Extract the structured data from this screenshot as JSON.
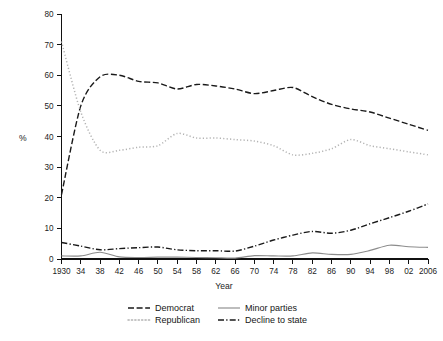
{
  "chart_data": {
    "type": "line",
    "title": "",
    "xlabel": "Year",
    "ylabel": "%",
    "xlim": [
      1930,
      2006
    ],
    "ylim": [
      0,
      80
    ],
    "grid": false,
    "legend_position": "bottom",
    "x": [
      1930,
      1934,
      1938,
      1942,
      1946,
      1950,
      1954,
      1958,
      1962,
      1966,
      1970,
      1974,
      1978,
      1982,
      1986,
      1990,
      1994,
      1998,
      2002,
      2006
    ],
    "xtick_labels": [
      "1930",
      "34",
      "38",
      "42",
      "46",
      "50",
      "54",
      "58",
      "62",
      "66",
      "70",
      "74",
      "78",
      "82",
      "86",
      "90",
      "94",
      "98",
      "02",
      "2006"
    ],
    "ytick_labels": [
      "0",
      "10",
      "20",
      "30",
      "40",
      "50",
      "60",
      "70",
      "80"
    ],
    "yticks": [
      0,
      10,
      20,
      30,
      40,
      50,
      60,
      70,
      80
    ],
    "series": [
      {
        "name": "Democrat",
        "style": "dashed",
        "color": "#1a1a1a",
        "values": [
          21,
          50,
          59.5,
          60,
          58,
          57.5,
          55.5,
          57,
          56.5,
          55.5,
          54,
          55,
          56,
          53,
          50.5,
          49,
          48,
          46,
          44,
          42
        ]
      },
      {
        "name": "Republican",
        "style": "dotted",
        "color": "#b3b3b3",
        "values": [
          71,
          48,
          35.5,
          35.5,
          36.5,
          37,
          41,
          39.5,
          39.5,
          39,
          38.5,
          37,
          34,
          34.5,
          36,
          39,
          37,
          36,
          35,
          34
        ]
      },
      {
        "name": "Minor parties",
        "style": "solid",
        "color": "#8c8c8c",
        "values": [
          1,
          1,
          2.2,
          0.7,
          0.5,
          0.6,
          0.6,
          0.5,
          0.4,
          0.3,
          1.1,
          1,
          1,
          2,
          1.5,
          1.5,
          2.8,
          4.5,
          4,
          3.8
        ]
      },
      {
        "name": "Decline to state",
        "style": "dashdot",
        "color": "#1a1a1a",
        "values": [
          5.4,
          4.2,
          3,
          3.4,
          3.7,
          3.9,
          3,
          2.7,
          2.7,
          2.6,
          4.2,
          6.2,
          7.8,
          9,
          8.4,
          9.4,
          11.5,
          13.5,
          15.6,
          18
        ]
      }
    ],
    "legend": [
      {
        "label": "Democrat",
        "style": "dashed",
        "color": "#1a1a1a"
      },
      {
        "label": "Minor parties",
        "style": "solid",
        "color": "#8c8c8c"
      },
      {
        "label": "Republican",
        "style": "dotted",
        "color": "#b3b3b3"
      },
      {
        "label": "Decline to state",
        "style": "dashdot",
        "color": "#1a1a1a"
      }
    ]
  }
}
